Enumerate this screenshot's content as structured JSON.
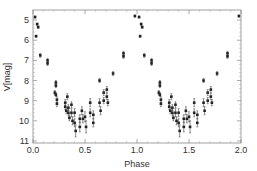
{
  "chart_data": {
    "type": "scatter",
    "title": "",
    "xlabel": "Phase",
    "ylabel": "V[mag]",
    "xlim": [
      0.0,
      2.0
    ],
    "ylim": [
      11.1,
      4.5
    ],
    "y_inverted": true,
    "grid": false,
    "legend": null,
    "x_ticks": [
      0.0,
      0.5,
      1.0,
      1.5,
      2.0
    ],
    "x_tick_labels": [
      "0.0",
      "0.5",
      "1.0",
      "1.5",
      "2.0"
    ],
    "y_ticks": [
      5,
      6,
      7,
      8,
      9,
      10,
      11
    ],
    "y_tick_labels": [
      "5",
      "6",
      "7",
      "8",
      "9",
      "10",
      "11"
    ],
    "note": "Phase-folded light curve shown over two cycles (phase 0-1 repeated at 1-2); points with vertical error bars",
    "series": [
      {
        "name": "V magnitude",
        "points": [
          {
            "x": 0.02,
            "y": 4.85,
            "err": 0.05
          },
          {
            "x": 0.04,
            "y": 5.2,
            "err": 0.05
          },
          {
            "x": 0.05,
            "y": 5.35,
            "err": 0.05
          },
          {
            "x": 0.03,
            "y": 5.8,
            "err": 0.05
          },
          {
            "x": 0.07,
            "y": 6.75,
            "err": 0.1
          },
          {
            "x": 0.14,
            "y": 7.0,
            "err": 0.1
          },
          {
            "x": 0.14,
            "y": 7.15,
            "err": 0.1
          },
          {
            "x": 0.22,
            "y": 8.1,
            "err": 0.1
          },
          {
            "x": 0.22,
            "y": 8.25,
            "err": 0.1
          },
          {
            "x": 0.21,
            "y": 8.6,
            "err": 0.1
          },
          {
            "x": 0.22,
            "y": 8.7,
            "err": 0.1
          },
          {
            "x": 0.23,
            "y": 8.95,
            "err": 0.15
          },
          {
            "x": 0.23,
            "y": 9.15,
            "err": 0.15
          },
          {
            "x": 0.31,
            "y": 9.1,
            "err": 0.15
          },
          {
            "x": 0.31,
            "y": 9.3,
            "err": 0.15
          },
          {
            "x": 0.32,
            "y": 9.5,
            "err": 0.15
          },
          {
            "x": 0.33,
            "y": 8.8,
            "err": 0.15
          },
          {
            "x": 0.34,
            "y": 9.35,
            "err": 0.15
          },
          {
            "x": 0.34,
            "y": 9.6,
            "err": 0.15
          },
          {
            "x": 0.35,
            "y": 9.85,
            "err": 0.15
          },
          {
            "x": 0.37,
            "y": 9.2,
            "err": 0.15
          },
          {
            "x": 0.37,
            "y": 9.6,
            "err": 0.2
          },
          {
            "x": 0.38,
            "y": 10.0,
            "err": 0.2
          },
          {
            "x": 0.4,
            "y": 9.6,
            "err": 0.2
          },
          {
            "x": 0.4,
            "y": 10.1,
            "err": 0.2
          },
          {
            "x": 0.41,
            "y": 10.5,
            "err": 0.3
          },
          {
            "x": 0.45,
            "y": 9.9,
            "err": 0.2
          },
          {
            "x": 0.45,
            "y": 10.3,
            "err": 0.25
          },
          {
            "x": 0.47,
            "y": 9.5,
            "err": 0.2
          },
          {
            "x": 0.48,
            "y": 9.9,
            "err": 0.2
          },
          {
            "x": 0.5,
            "y": 9.8,
            "err": 0.25
          },
          {
            "x": 0.51,
            "y": 10.3,
            "err": 0.3
          },
          {
            "x": 0.55,
            "y": 9.1,
            "err": 0.2
          },
          {
            "x": 0.55,
            "y": 9.6,
            "err": 0.2
          },
          {
            "x": 0.58,
            "y": 9.7,
            "err": 0.2
          },
          {
            "x": 0.58,
            "y": 10.1,
            "err": 0.2
          },
          {
            "x": 0.64,
            "y": 8.0,
            "err": 0.1
          },
          {
            "x": 0.64,
            "y": 9.1,
            "err": 0.2
          },
          {
            "x": 0.65,
            "y": 9.5,
            "err": 0.2
          },
          {
            "x": 0.68,
            "y": 8.6,
            "err": 0.15
          },
          {
            "x": 0.68,
            "y": 9.0,
            "err": 0.15
          },
          {
            "x": 0.71,
            "y": 8.45,
            "err": 0.15
          },
          {
            "x": 0.71,
            "y": 8.8,
            "err": 0.15
          },
          {
            "x": 0.72,
            "y": 9.1,
            "err": 0.15
          },
          {
            "x": 0.77,
            "y": 7.65,
            "err": 0.1
          },
          {
            "x": 0.87,
            "y": 6.65,
            "err": 0.1
          },
          {
            "x": 0.87,
            "y": 6.8,
            "err": 0.1
          },
          {
            "x": 0.98,
            "y": 4.8,
            "err": 0.05
          }
        ]
      }
    ]
  }
}
